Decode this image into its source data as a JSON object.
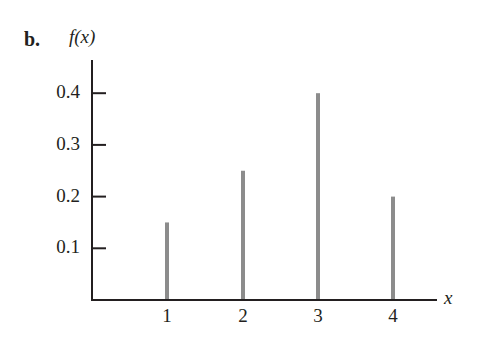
{
  "figure": {
    "part_label": "b.",
    "y_axis_label": "f(x)",
    "x_axis_label": "x"
  },
  "chart_data": {
    "type": "bar",
    "subtype": "stem / probability mass function",
    "title": "",
    "part_label": "b.",
    "xlabel": "x",
    "ylabel": "f(x)",
    "categories": [
      1,
      2,
      3,
      4
    ],
    "values": [
      0.15,
      0.25,
      0.4,
      0.2
    ],
    "x_ticks": [
      "1",
      "2",
      "3",
      "4"
    ],
    "y_ticks": [
      "0.1",
      "0.2",
      "0.3",
      "0.4"
    ],
    "ylim": [
      0,
      0.45
    ],
    "grid": false,
    "legend": null,
    "bar_color": "#8c8c8c",
    "axis_color": "#231f20"
  }
}
